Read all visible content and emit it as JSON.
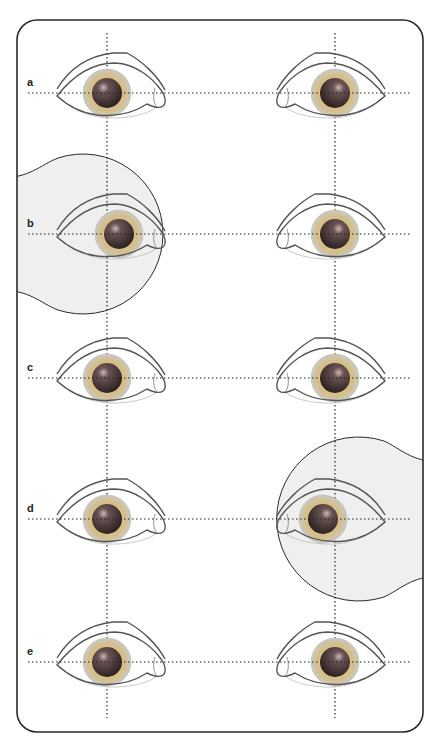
{
  "figure": {
    "rows": [
      {
        "label": "a",
        "y": 93,
        "left_iris_dx": 0,
        "right_iris_dx": 0,
        "highlight": "none"
      },
      {
        "label": "b",
        "y": 234,
        "left_iris_dx": 12,
        "right_iris_dx": 0,
        "highlight": "left"
      },
      {
        "label": "c",
        "y": 378,
        "left_iris_dx": 0,
        "right_iris_dx": 0,
        "highlight": "none"
      },
      {
        "label": "d",
        "y": 519,
        "left_iris_dx": 0,
        "right_iris_dx": -12,
        "highlight": "right"
      },
      {
        "label": "e",
        "y": 662,
        "left_iris_dx": 0,
        "right_iris_dx": 0,
        "highlight": "none"
      }
    ],
    "columns": {
      "left_x": 107,
      "right_x": 335
    },
    "colors": {
      "frame": "#2a2a2a",
      "highlight_fill": "#efefef",
      "eye_outline": "#555555",
      "iris_outer": "#d9c28a",
      "pupil": "#4a3b3b",
      "guide": "#222222"
    }
  }
}
